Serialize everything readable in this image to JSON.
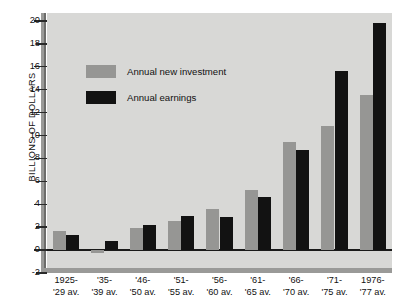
{
  "chart_data": {
    "type": "bar",
    "title": "",
    "xlabel": "",
    "ylabel": "BILLIONS OF DOLLARS",
    "ylim": [
      -2,
      20
    ],
    "ytick_step": 2,
    "yticks": [
      20,
      18,
      16,
      14,
      12,
      10,
      8,
      6,
      4,
      2,
      0,
      -2
    ],
    "ytick_labels": [
      "20",
      "18",
      "16",
      "14",
      "12",
      "10",
      "8",
      "6",
      "4",
      "2",
      "0",
      "-2"
    ],
    "grid": false,
    "legend_position": "upper-left-inside",
    "categories": [
      "1925-\n'29 av.",
      "'35-\n'39 av.",
      "'46-\n'50 av.",
      "'51-\n'55 av.",
      "'56-\n'60 av.",
      "'61-\n'65 av.",
      "'66-\n'70 av.",
      "'71-\n'75 av.",
      "1976-\n'77 av."
    ],
    "category_lines": [
      [
        "1925-",
        "'29 av."
      ],
      [
        "'35-",
        "'39 av."
      ],
      [
        "'46-",
        "'50 av."
      ],
      [
        "'51-",
        "'55 av."
      ],
      [
        "'56-",
        "'60 av."
      ],
      [
        "'61-",
        "'65 av."
      ],
      [
        "'66-",
        "'70 av."
      ],
      [
        "'71-",
        "'75 av."
      ],
      [
        "1976-",
        "'77 av."
      ]
    ],
    "series": [
      {
        "name": "Annual new investment",
        "color": "#969694",
        "values": [
          1.7,
          -0.3,
          1.9,
          2.5,
          3.6,
          5.2,
          9.4,
          10.8,
          13.5
        ]
      },
      {
        "name": "Annual earnings",
        "color": "#121212",
        "values": [
          1.3,
          0.8,
          2.2,
          3.0,
          2.9,
          4.6,
          8.7,
          15.6,
          19.8
        ]
      }
    ]
  },
  "legend": {
    "items": [
      {
        "label": "Annual new investment",
        "color": "#969694"
      },
      {
        "label": "Annual earnings",
        "color": "#121212"
      }
    ]
  },
  "colors": {
    "plot_background": "#d8d8d6",
    "page_background": "#ffffff",
    "axis": "#9a9a98",
    "baseline": "#1a1a1a",
    "investment": "#969694",
    "earnings": "#121212"
  }
}
